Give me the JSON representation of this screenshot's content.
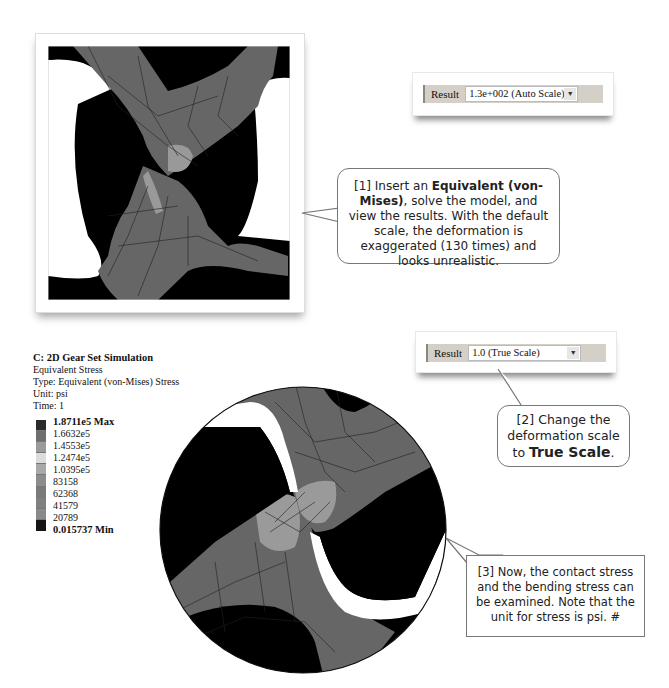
{
  "top_panel": {
    "description": "FEA deformed mesh, auto scale"
  },
  "result_auto": {
    "label": "Result",
    "value": "1.3e+002 (Auto Scale)",
    "arrow": "▼"
  },
  "callout1": {
    "prefix": "[1] Insert an ",
    "bold": "Equivalent (von-Mises)",
    "suffix": ", solve the model,  and view the results. With the default scale, the deformation is exaggerated (130 times) and looks unrealistic."
  },
  "legend": {
    "title": "C: 2D Gear Set Simulation",
    "lines": [
      "Equivalent Stress",
      "Type: Equivalent (von-Mises) Stress",
      "Unit: psi",
      "Time: 1"
    ],
    "max_label": "1.8711e5 Max",
    "labels": [
      "1.6632e5",
      "1.4553e5",
      "1.2474e5",
      "1.0395e5",
      "83158",
      "62368",
      "41579",
      "20789"
    ],
    "min_label": "0.015737 Min",
    "colors": [
      "#2a2a2a",
      "#6e6e6e",
      "#9a9a9a",
      "#dcdcdc",
      "#a8a8a8",
      "#8c8c8c",
      "#7a7a7a",
      "#808080",
      "#8a8a8a",
      "#151515"
    ]
  },
  "result_true": {
    "label": "Result",
    "value": "1.0 (True Scale)",
    "arrow": "▼"
  },
  "callout2": {
    "prefix": "[2] Change the deformation scale to ",
    "bold": "True Scale",
    "suffix": "."
  },
  "callout3": {
    "text": "[3] Now, the contact stress and the bending stress can be examined.  Note that the unit for stress is psi. #"
  }
}
